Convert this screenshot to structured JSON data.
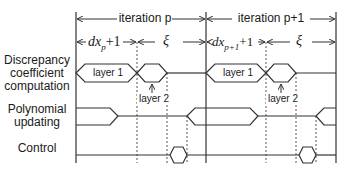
{
  "signals": [
    {
      "label": "Discrepancy coefficient computation",
      "lines": [
        "Discrepancy",
        "coefficient",
        "computation"
      ]
    },
    {
      "label": "Polynomial updating",
      "lines": [
        "Polynomial",
        "updating"
      ]
    },
    {
      "label": "Control",
      "lines": [
        "Control"
      ]
    }
  ],
  "iterations": [
    {
      "label": "iteration p"
    },
    {
      "label": "iteration p+1"
    }
  ],
  "phases": [
    {
      "var": "dx",
      "sub": "p",
      "suffix": "+1"
    },
    {
      "greek": "ξ"
    },
    {
      "var": "dx",
      "sub": "p+1",
      "suffix": "+1"
    },
    {
      "greek": "ξ"
    }
  ],
  "blocks": {
    "layer1": "layer 1",
    "layer2": "layer 2"
  },
  "colors": {
    "line": "#333333",
    "dotted": "#555555"
  }
}
